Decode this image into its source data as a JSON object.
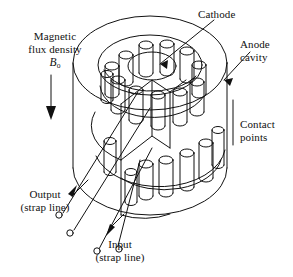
{
  "figure": {
    "type": "technical-line-diagram",
    "style": {
      "line_color": "#111111",
      "background": "#ffffff",
      "fill": "none",
      "stroke_width": 1.0
    },
    "labels": {
      "magnetic_flux_line1": "Magnetic",
      "magnetic_flux_line2": "flux density",
      "magnetic_flux_symbol": "B",
      "magnetic_flux_subscript": "o",
      "cathode": "Cathode",
      "anode_cavity_line1": "Anode",
      "anode_cavity_line2": "cavity",
      "contact_points_line1": "Contact",
      "contact_points_line2": "points",
      "output_line1": "Output",
      "output_line2": "(strap line)",
      "input_line1": "Input",
      "input_line2": "(strap line)"
    },
    "components": {
      "outer_cylinder": "anode block outer cylinder",
      "top_face_ellipse": "top circular face of anode block",
      "upper_post_ring": "upper ring of cylindrical cavity posts",
      "lower_post_ring": "lower ring of cylindrical cavity posts",
      "central_cavity": "central cathode cavity ellipse",
      "strap_rings": "strap line rings connecting alternate posts",
      "terminals": "small open-circle strap line terminals",
      "flux_arrow": "downward arrow indicating B-field direction"
    },
    "counts": {
      "upper_posts": 12,
      "lower_posts": 7,
      "terminals": 4,
      "leader_arrows": 4
    }
  }
}
